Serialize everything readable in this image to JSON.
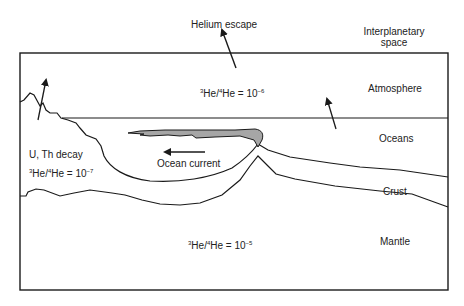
{
  "diagram": {
    "type": "helium cycle cross-section",
    "regions": {
      "space": {
        "label_line1": "Interplanetary",
        "label_line2": "space"
      },
      "atmosphere": {
        "label": "Atmosphere",
        "ratio": {
          "num_mass": "3",
          "den_mass": "4",
          "prefix": "He/",
          "suffix": "He = 10",
          "exponent": "−6"
        }
      },
      "oceans": {
        "label": "Oceans"
      },
      "crust": {
        "label": "Crust",
        "source_label": "U, Th decay",
        "ratio": {
          "num_mass": "3",
          "den_mass": "4",
          "prefix": "He/",
          "suffix": "He = 10",
          "exponent": "−7"
        }
      },
      "mantle": {
        "label": "Mantle",
        "ratio": {
          "num_mass": "3",
          "den_mass": "4",
          "prefix": "He/",
          "suffix": "He = 10",
          "exponent": "−5"
        }
      }
    },
    "annotations": {
      "helium_escape": "Helium escape",
      "ocean_current": "Ocean current"
    },
    "colors": {
      "line": "#1a1a1a",
      "plume_fill": "#a6a6a6",
      "background": "#ffffff"
    }
  }
}
